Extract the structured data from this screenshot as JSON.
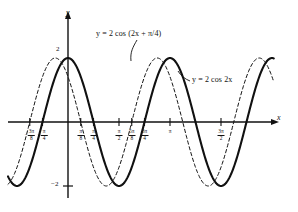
{
  "figure": {
    "background": "#ffffff",
    "ink": "#111111"
  },
  "axes": {
    "x_label": "x",
    "y_label": "y",
    "origin_px": {
      "x": 68,
      "y": 122
    },
    "x_unit_pi_px": 102,
    "y_unit_px": 32,
    "x_range_px": {
      "left": 8,
      "right": 268
    },
    "y_tick_labels": [
      {
        "text": "2",
        "value": 2
      },
      {
        "text": "−2",
        "value": -2
      }
    ],
    "x_ticks": [
      {
        "text_neg": "−",
        "num": "3π",
        "den": "8",
        "value": -1.1781,
        "label": "-3pi/8"
      },
      {
        "text_neg": "−",
        "num": "π",
        "den": "4",
        "value": -0.7854,
        "label": "-pi/4"
      },
      {
        "text_neg": "",
        "num": "π",
        "den": "8",
        "value": 0.3927,
        "label": "pi/8"
      },
      {
        "text_neg": "",
        "num": "π",
        "den": "4",
        "value": 0.7854,
        "label": "pi/4"
      },
      {
        "text_neg": "",
        "num": "π",
        "den": "2",
        "value": 1.5708,
        "label": "pi/2"
      },
      {
        "text_neg": "",
        "num": "5π",
        "den": "8",
        "value": 1.9635,
        "label": "5pi/8"
      },
      {
        "text_neg": "",
        "num": "3π",
        "den": "4",
        "value": 2.3562,
        "label": "3pi/4"
      },
      {
        "text_neg": "",
        "num": "",
        "den": "",
        "whole": "π",
        "value": 3.1416,
        "label": "pi"
      },
      {
        "text_neg": "",
        "num": "3π",
        "den": "2",
        "value": 4.7124,
        "label": "3pi/2"
      }
    ]
  },
  "annotations": {
    "shifted_label": "y = 2 cos (2x + π/4)",
    "base_label": "y = 2 cos 2x"
  },
  "chart_data": {
    "type": "line",
    "title": "",
    "xlabel": "x",
    "ylabel": "y",
    "xlim": [
      -1.7671,
      5.9
    ],
    "ylim": [
      -2.6,
      2.6
    ],
    "grid": false,
    "legend": "inline-annotations",
    "series": [
      {
        "name": "y = 2 cos 2x",
        "expression": "2*cos(2*x)",
        "amplitude": 2,
        "period": 3.1416,
        "phase_shift": 0,
        "style": "solid",
        "linewidth": 2.1,
        "color": "#111111",
        "key_points": {
          "maxima_x": [
            0,
            3.1416
          ],
          "minima_x": [
            -1.5708,
            1.5708,
            4.7124
          ],
          "zeros_x": [
            -0.7854,
            0.7854,
            2.3562,
            3.927,
            5.4978
          ]
        }
      },
      {
        "name": "y = 2 cos (2x + π/4)",
        "expression": "2*cos(2*x + pi/4)",
        "amplitude": 2,
        "period": 3.1416,
        "phase_shift": -0.3927,
        "style": "dashed",
        "linewidth": 1.0,
        "color": "#111111",
        "key_points": {
          "maxima_x": [
            -0.3927,
            2.7489
          ],
          "minima_x": [
            1.1781,
            4.3197
          ],
          "zeros_x": [
            -1.1781,
            0.3927,
            1.9635,
            3.5343,
            5.105
          ]
        }
      }
    ]
  }
}
